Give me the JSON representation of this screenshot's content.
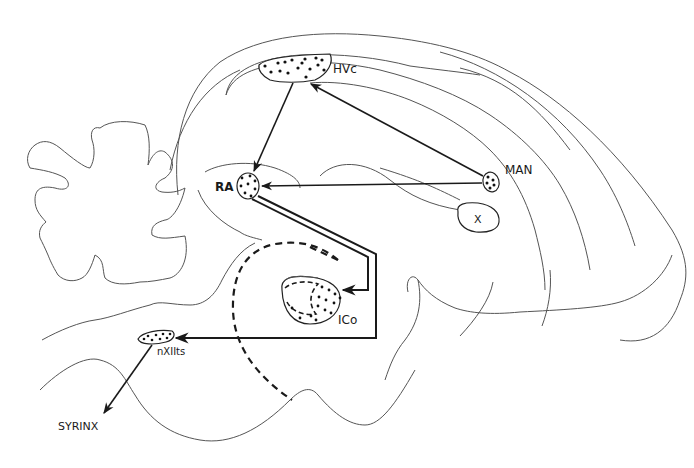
{
  "diagram": {
    "labels": {
      "hvc": "HVc",
      "ra": "RA",
      "man": "MAN",
      "x": "X",
      "ico": "ICo",
      "nxiits": "nXIIts",
      "syrinx": "SYRINX"
    },
    "nodes": [
      {
        "id": "hvc",
        "label": "HVc"
      },
      {
        "id": "ra",
        "label": "RA"
      },
      {
        "id": "man",
        "label": "MAN"
      },
      {
        "id": "x",
        "label": "X"
      },
      {
        "id": "ico",
        "label": "ICo"
      },
      {
        "id": "nxiits",
        "label": "nXIIts"
      },
      {
        "id": "syrinx",
        "label": "SYRINX"
      }
    ],
    "edges": [
      {
        "from": "hvc",
        "to": "ra"
      },
      {
        "from": "man",
        "to": "hvc"
      },
      {
        "from": "man",
        "to": "ra"
      },
      {
        "from": "ra",
        "to": "ico"
      },
      {
        "from": "ra",
        "to": "nxiits"
      },
      {
        "from": "nxiits",
        "to": "syrinx"
      }
    ],
    "colors": {
      "ink": "#1a1a1a",
      "outline": "#555555",
      "background": "#ffffff"
    }
  }
}
